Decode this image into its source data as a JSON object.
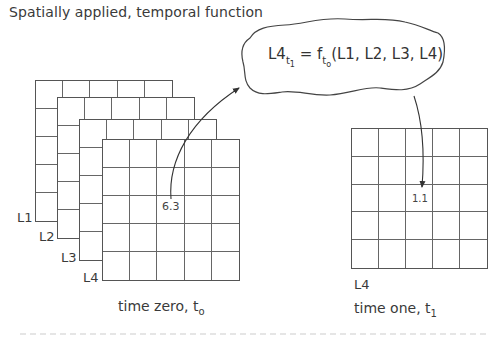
{
  "title": "Spatially applied, temporal function",
  "formula": {
    "lhs": "L4",
    "lhs_sub": "t",
    "lhs_subsub": "1",
    "equals": " = f",
    "f_sub": "t",
    "f_subsub": "o",
    "args": "(L1, L2, L3, L4)"
  },
  "left_stack": {
    "layers": [
      {
        "label": "L1"
      },
      {
        "label": "L2"
      },
      {
        "label": "L3"
      },
      {
        "label": "L4"
      }
    ],
    "rows": 5,
    "cols": 5,
    "highlight_cell": {
      "row": 3,
      "col": 3,
      "value": "6.3"
    },
    "caption": "time zero, t",
    "caption_sub": "o"
  },
  "right_grid": {
    "label": "L4",
    "rows": 5,
    "cols": 5,
    "highlight_cell": {
      "row": 3,
      "col": 3,
      "value": "1.1"
    },
    "caption": "time one, t",
    "caption_sub": "1"
  },
  "colors": {
    "line": "#555555",
    "text": "#3a3a3a",
    "background": "#ffffff"
  }
}
